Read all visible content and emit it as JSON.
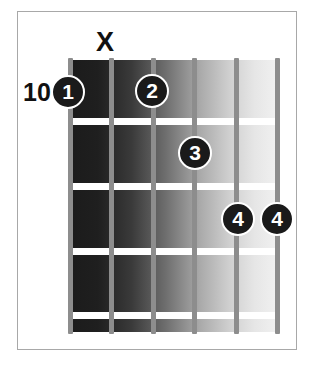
{
  "diagram": {
    "type": "guitar-chord-diagram",
    "fret_number_label": "10",
    "muted_string_marker": "X",
    "muted_string_index": 2,
    "string_count": 6,
    "fret_count": 5,
    "strings": [
      {
        "index": 1,
        "x": 70
      },
      {
        "index": 2,
        "x": 111
      },
      {
        "index": 3,
        "x": 153
      },
      {
        "index": 4,
        "x": 194
      },
      {
        "index": 5,
        "x": 236
      },
      {
        "index": 6,
        "x": 277
      }
    ],
    "fret_lines": [
      {
        "index": 1,
        "y": 118
      },
      {
        "index": 2,
        "y": 183
      },
      {
        "index": 3,
        "y": 248
      },
      {
        "index": 4,
        "y": 312
      }
    ],
    "markers": [
      {
        "label": "1",
        "string": 1,
        "fret": 1,
        "x": 68,
        "y": 92
      },
      {
        "label": "2",
        "string": 3,
        "fret": 1,
        "x": 152,
        "y": 91
      },
      {
        "label": "3",
        "string": 4,
        "fret": 2,
        "x": 195,
        "y": 153
      },
      {
        "label": "4",
        "string": 5,
        "fret": 3,
        "x": 238,
        "y": 219
      },
      {
        "label": "4",
        "string": 6,
        "fret": 3,
        "x": 277,
        "y": 219
      }
    ],
    "colors": {
      "board_dark": "#1b1b1b",
      "board_light": "#f2f2f2",
      "string": "#8d8d8d",
      "fret_line": "#ffffff",
      "marker_fill": "#1a1a1a",
      "marker_text": "#ffffff",
      "frame_border": "#a8a8a8",
      "page_background": "#ffffff"
    }
  }
}
